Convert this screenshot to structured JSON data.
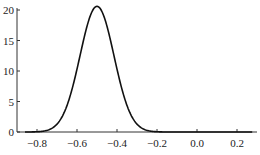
{
  "chart_data": {
    "type": "line",
    "title": "",
    "xlabel": "",
    "ylabel": "",
    "xlim": [
      -0.9,
      0.3
    ],
    "ylim": [
      0,
      21
    ],
    "grid": false,
    "legend": null,
    "x_ticks": [
      -0.8,
      -0.6,
      -0.4,
      -0.2,
      0.0,
      0.2
    ],
    "x_tick_labels": [
      "-0.8",
      "-0.6",
      "-0.4",
      "-0.2",
      "0.0",
      "0.2"
    ],
    "y_ticks": [
      0,
      5,
      10,
      15,
      20
    ],
    "y_tick_labels": [
      "0",
      "5",
      "10",
      "15",
      "20"
    ],
    "series": [
      {
        "name": "density",
        "shape": "gaussian",
        "mean": -0.5,
        "sigma": 0.085,
        "peak": 20.6,
        "x": [
          -0.9,
          -0.8,
          -0.75,
          -0.7,
          -0.65,
          -0.6,
          -0.55,
          -0.5,
          -0.45,
          -0.4,
          -0.35,
          -0.3,
          -0.25,
          -0.2,
          -0.1,
          0.0,
          0.1,
          0.2,
          0.3
        ],
        "values": [
          0.0,
          0.04,
          0.27,
          1.3,
          4.6,
          10.2,
          17.0,
          20.6,
          17.0,
          10.2,
          4.6,
          1.3,
          0.27,
          0.04,
          0.0,
          0.0,
          0.0,
          0.0,
          0.0
        ]
      }
    ]
  }
}
